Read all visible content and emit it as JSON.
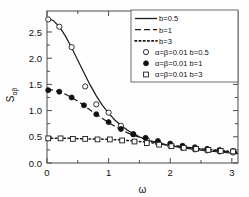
{
  "chart_data": {
    "type": "line",
    "title": "",
    "xlabel": "ω",
    "ylabel": "S",
    "ylabel_sub": "αβ",
    "xlim": [
      0,
      3.1
    ],
    "ylim": [
      0,
      2.9
    ],
    "xticks": [
      "0",
      "1",
      "2",
      "3"
    ],
    "xtick_values": [
      0,
      1,
      2,
      3
    ],
    "yticks": [
      "0.0",
      "0.5",
      "1.0",
      "1.5",
      "2.0",
      "2.5"
    ],
    "ytick_values": [
      0.0,
      0.5,
      1.0,
      1.5,
      2.0,
      2.5
    ],
    "xminor_values": [
      0.5,
      1.5,
      2.5
    ],
    "yminor_values": [
      0.25,
      0.75,
      1.25,
      1.75,
      2.25,
      2.75
    ],
    "grid": false,
    "legend_position": "upper-right",
    "series": [
      {
        "name": "b=0.5",
        "style": "solid",
        "color": "#1a1a1a",
        "x": [
          0.0,
          0.1,
          0.2,
          0.3,
          0.4,
          0.5,
          0.6,
          0.7,
          0.8,
          0.9,
          1.0,
          1.1,
          1.2,
          1.3,
          1.4,
          1.5,
          1.6,
          1.7,
          1.8,
          1.9,
          2.0,
          2.2,
          2.4,
          2.6,
          2.8,
          3.0,
          3.1
        ],
        "y": [
          2.76,
          2.72,
          2.6,
          2.42,
          2.2,
          1.96,
          1.72,
          1.49,
          1.28,
          1.1,
          0.95,
          0.82,
          0.72,
          0.63,
          0.56,
          0.5,
          0.45,
          0.41,
          0.38,
          0.35,
          0.33,
          0.29,
          0.26,
          0.23,
          0.21,
          0.19,
          0.18
        ]
      },
      {
        "name": "b=1",
        "style": "dashed",
        "color": "#1a1a1a",
        "x": [
          0.0,
          0.1,
          0.2,
          0.3,
          0.4,
          0.5,
          0.6,
          0.7,
          0.8,
          0.9,
          1.0,
          1.1,
          1.2,
          1.3,
          1.4,
          1.5,
          1.6,
          1.7,
          1.8,
          1.9,
          2.0,
          2.2,
          2.4,
          2.6,
          2.8,
          3.0,
          3.1
        ],
        "y": [
          1.4,
          1.39,
          1.36,
          1.31,
          1.25,
          1.18,
          1.1,
          1.01,
          0.93,
          0.85,
          0.77,
          0.7,
          0.64,
          0.58,
          0.53,
          0.49,
          0.45,
          0.42,
          0.39,
          0.36,
          0.34,
          0.31,
          0.28,
          0.25,
          0.23,
          0.21,
          0.2
        ]
      },
      {
        "name": "b=3",
        "style": "dotted",
        "color": "#1a1a1a",
        "x": [
          0.0,
          0.2,
          0.4,
          0.6,
          0.8,
          1.0,
          1.2,
          1.4,
          1.6,
          1.8,
          2.0,
          2.2,
          2.4,
          2.6,
          2.8,
          3.0,
          3.1
        ],
        "y": [
          0.47,
          0.47,
          0.47,
          0.46,
          0.46,
          0.45,
          0.44,
          0.42,
          0.4,
          0.37,
          0.34,
          0.31,
          0.28,
          0.26,
          0.24,
          0.22,
          0.21
        ]
      }
    ],
    "marker_series": [
      {
        "name": "α=β=0.01  b=0.5",
        "marker": "open-circle",
        "x": [
          0.02,
          0.2,
          0.4,
          0.62,
          0.8,
          1.0,
          1.2,
          1.4,
          1.62,
          1.8,
          2.0,
          2.2,
          2.4,
          2.6,
          2.8,
          3.02
        ],
        "y": [
          2.74,
          2.6,
          2.21,
          1.46,
          1.12,
          0.96,
          0.71,
          0.55,
          0.44,
          0.38,
          0.33,
          0.29,
          0.26,
          0.24,
          0.22,
          0.2
        ]
      },
      {
        "name": "α=β=0.01  b=1",
        "marker": "filled-circle",
        "x": [
          0.02,
          0.2,
          0.4,
          0.6,
          0.8,
          1.0,
          1.2,
          1.4,
          1.6,
          1.8,
          2.0,
          2.2,
          2.4,
          2.6,
          2.8,
          3.02
        ],
        "y": [
          1.39,
          1.36,
          1.25,
          1.1,
          0.93,
          0.78,
          0.65,
          0.55,
          0.48,
          0.42,
          0.37,
          0.33,
          0.3,
          0.27,
          0.25,
          0.23
        ]
      },
      {
        "name": "α=β=0.01  b=3",
        "marker": "open-square",
        "x": [
          0.02,
          0.22,
          0.42,
          0.62,
          0.82,
          1.02,
          1.22,
          1.42,
          1.62,
          1.82,
          2.02,
          2.22,
          2.42,
          2.62,
          2.82,
          3.02
        ],
        "y": [
          0.47,
          0.47,
          0.46,
          0.46,
          0.45,
          0.45,
          0.43,
          0.41,
          0.38,
          0.35,
          0.32,
          0.29,
          0.27,
          0.25,
          0.23,
          0.22
        ]
      }
    ],
    "legend_entries": [
      {
        "label": "b=0.5",
        "kind": "line",
        "style": "solid"
      },
      {
        "label": "b=1",
        "kind": "line",
        "style": "dashed"
      },
      {
        "label": "b=3",
        "kind": "line",
        "style": "dotted"
      },
      {
        "label": "α=β=0.01  b=0.5",
        "kind": "marker",
        "style": "open-circle"
      },
      {
        "label": "α=β=0.01  b=1",
        "kind": "marker",
        "style": "filled-circle"
      },
      {
        "label": "α=β=0.01  b=3",
        "kind": "marker",
        "style": "open-square"
      }
    ]
  }
}
